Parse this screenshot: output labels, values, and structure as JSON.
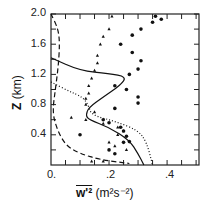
{
  "chart_data": {
    "type": "line",
    "title": "",
    "xlabel": "w'^2 (m^2 s^-2)",
    "ylabel": "Z (km)",
    "xlim": [
      0,
      0.51
    ],
    "ylim": [
      0,
      2.0
    ],
    "x_ticks": [
      "0.",
      ".2",
      ".4"
    ],
    "y_ticks": [
      "0.4",
      "0.8",
      "1.2",
      "1.6",
      "2.0"
    ],
    "grid": false,
    "legend": null,
    "series": [
      {
        "name": "solid",
        "style": "solid",
        "points": [
          [
            0.0,
            1.42
          ],
          [
            0.1,
            1.25
          ],
          [
            0.2,
            1.21
          ],
          [
            0.26,
            1.17
          ],
          [
            0.24,
            1.06
          ],
          [
            0.18,
            0.9
          ],
          [
            0.13,
            0.76
          ],
          [
            0.12,
            0.66
          ],
          [
            0.13,
            0.6
          ],
          [
            0.2,
            0.5
          ],
          [
            0.27,
            0.33
          ],
          [
            0.3,
            0.15
          ],
          [
            0.32,
            0.0
          ]
        ]
      },
      {
        "name": "dotted",
        "style": "dotted",
        "points": [
          [
            0.0,
            1.1
          ],
          [
            0.06,
            0.98
          ],
          [
            0.11,
            0.9
          ],
          [
            0.13,
            0.78
          ],
          [
            0.14,
            0.66
          ],
          [
            0.22,
            0.58
          ],
          [
            0.3,
            0.46
          ],
          [
            0.33,
            0.3
          ],
          [
            0.35,
            0.0
          ]
        ]
      },
      {
        "name": "dashed",
        "style": "dashed",
        "points": [
          [
            0.0,
            2.0
          ],
          [
            0.025,
            1.8
          ],
          [
            0.03,
            1.6
          ],
          [
            0.025,
            1.3
          ],
          [
            0.015,
            1.0
          ],
          [
            0.005,
            0.7
          ],
          [
            0.02,
            0.48
          ],
          [
            0.05,
            0.26
          ],
          [
            0.1,
            0.15
          ],
          [
            0.17,
            0.07
          ],
          [
            0.27,
            0.02
          ]
        ]
      },
      {
        "name": "dots",
        "style": "markers-circle",
        "points": [
          [
            0.36,
            1.97
          ],
          [
            0.38,
            1.93
          ],
          [
            0.35,
            1.89
          ],
          [
            0.31,
            1.8
          ],
          [
            0.28,
            1.72
          ],
          [
            0.24,
            1.6
          ],
          [
            0.28,
            1.49
          ],
          [
            0.31,
            1.38
          ],
          [
            0.3,
            1.27
          ],
          [
            0.27,
            1.2
          ],
          [
            0.22,
            1.05
          ],
          [
            0.26,
            1.0
          ],
          [
            0.3,
            0.9
          ],
          [
            0.3,
            0.82
          ],
          [
            0.22,
            0.75
          ],
          [
            0.18,
            0.6
          ],
          [
            0.2,
            0.56
          ],
          [
            0.24,
            0.5
          ],
          [
            0.25,
            0.45
          ],
          [
            0.26,
            0.38
          ],
          [
            0.25,
            0.3
          ],
          [
            0.27,
            0.31
          ],
          [
            0.2,
            0.2
          ],
          [
            0.22,
            0.15
          ],
          [
            0.1,
            0.4
          ]
        ]
      },
      {
        "name": "triangles",
        "style": "markers-triangle",
        "points": [
          [
            0.21,
            1.97
          ],
          [
            0.2,
            1.8
          ],
          [
            0.18,
            1.7
          ],
          [
            0.17,
            1.6
          ],
          [
            0.16,
            1.45
          ],
          [
            0.16,
            1.35
          ],
          [
            0.15,
            1.25
          ],
          [
            0.14,
            1.15
          ],
          [
            0.13,
            1.05
          ],
          [
            0.13,
            0.95
          ],
          [
            0.12,
            0.88
          ],
          [
            0.12,
            0.8
          ],
          [
            0.15,
            0.7
          ],
          [
            0.12,
            0.6
          ],
          [
            0.18,
            0.55
          ],
          [
            0.23,
            0.5
          ],
          [
            0.25,
            0.45
          ],
          [
            0.23,
            0.4
          ],
          [
            0.2,
            0.3
          ],
          [
            0.22,
            0.25
          ],
          [
            0.26,
            0.2
          ],
          [
            0.07,
            0.63
          ],
          [
            0.14,
            0.05
          ],
          [
            0.18,
            0.05
          ]
        ]
      }
    ]
  },
  "axes": {
    "y_label_main": "Z",
    "y_label_unit": "(km)",
    "x_label_main": "w'²",
    "x_label_unit": "(m²s⁻²)"
  }
}
